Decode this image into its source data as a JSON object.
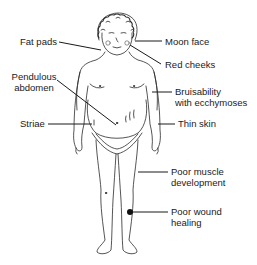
{
  "diagram": {
    "type": "anatomical-illustration",
    "labels": {
      "fat_pads": "Fat pads",
      "pendulous_abdomen_1": "Pendulous",
      "pendulous_abdomen_2": "abdomen",
      "striae": "Striae",
      "moon_face": "Moon face",
      "red_cheeks": "Red cheeks",
      "bruisability_1": "Bruisability",
      "bruisability_2": "with ecchymoses",
      "thin_skin": "Thin skin",
      "poor_muscle_1": "Poor muscle",
      "poor_muscle_2": "development",
      "poor_wound_1": "Poor wound",
      "poor_wound_2": "healing"
    },
    "colors": {
      "line": "#1a1a1a",
      "background": "#ffffff"
    }
  }
}
